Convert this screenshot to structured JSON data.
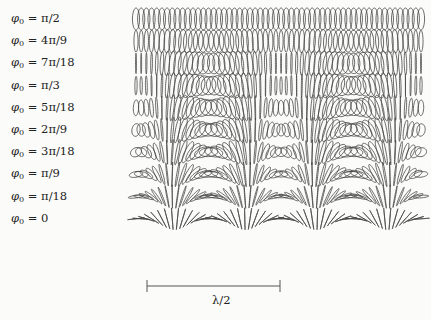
{
  "figure": {
    "rows": [
      {
        "label": "π/2",
        "phi": 1.5707963
      },
      {
        "label": "4π/9",
        "phi": 1.3962634
      },
      {
        "label": "7π/18",
        "phi": 1.2217305
      },
      {
        "label": "π/3",
        "phi": 1.0471976
      },
      {
        "label": "5π/18",
        "phi": 0.8726646
      },
      {
        "label": "2π/9",
        "phi": 0.6981317
      },
      {
        "label": "3π/18",
        "phi": 0.5235988
      },
      {
        "label": "π/9",
        "phi": 0.3490659
      },
      {
        "label": "π/18",
        "phi": 0.1745329
      },
      {
        "label": "0",
        "phi": 0
      }
    ],
    "label_prefix": "φ",
    "label_subscript": "0",
    "label_equals": " = ",
    "scale_bar": {
      "label": "λ/2",
      "x1": 147,
      "x2": 280,
      "y": 286
    },
    "plot": {
      "x_start": 136,
      "x_end": 421,
      "ellipse_count": 56,
      "row_top": 19,
      "row_spacing": 22.2,
      "period_px": 142,
      "center_x": 210,
      "stroke_color": "#444444"
    }
  }
}
